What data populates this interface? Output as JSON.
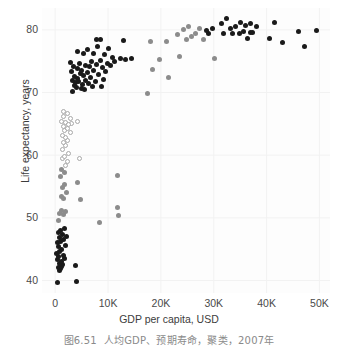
{
  "figure": {
    "caption_number": "图6.51",
    "caption_text": "人均GDP、预期寿命，聚类，2007年"
  },
  "chart_data": {
    "type": "scatter",
    "title": "",
    "xlabel": "GDP per capita, USD",
    "ylabel": "Life expectancy, years",
    "xlim": [
      -2500,
      52000
    ],
    "ylim": [
      38,
      83.5
    ],
    "xticks": [
      0,
      10000,
      20000,
      30000,
      40000,
      50000
    ],
    "xticklabels": [
      "0",
      "10K",
      "20K",
      "30K",
      "40K",
      "50K"
    ],
    "yticks": [
      40,
      50,
      60,
      70,
      80
    ],
    "yticklabels": [
      "40",
      "50",
      "60",
      "70",
      "80"
    ],
    "grid": true,
    "grid_color": "#f2f2f2",
    "background": "#fdfdfd",
    "legend": null,
    "marker_size": 5,
    "clusters": [
      {
        "name": "cluster-dark",
        "color": "#1a1a1a",
        "fill": "#1a1a1a",
        "stroke": "#1a1a1a"
      },
      {
        "name": "cluster-gray",
        "color": "#8c8c8c",
        "fill": "#8c8c8c",
        "stroke": "#8c8c8c"
      },
      {
        "name": "cluster-open",
        "color": "#b0b0b0",
        "fill": "#ffffff",
        "stroke": "#a8a8a8"
      }
    ],
    "points": [
      {
        "x": 430,
        "y": 39.6,
        "c": 0
      },
      {
        "x": 4000,
        "y": 39.8,
        "c": 0
      },
      {
        "x": 3800,
        "y": 42.4,
        "c": 0
      },
      {
        "x": 780,
        "y": 41.6,
        "c": 0
      },
      {
        "x": 950,
        "y": 41.9,
        "c": 0
      },
      {
        "x": 640,
        "y": 42.1,
        "c": 0
      },
      {
        "x": 1200,
        "y": 42.3,
        "c": 0
      },
      {
        "x": 1400,
        "y": 42.6,
        "c": 0
      },
      {
        "x": 870,
        "y": 42.7,
        "c": 0
      },
      {
        "x": 1100,
        "y": 43.0,
        "c": 0
      },
      {
        "x": 520,
        "y": 43.3,
        "c": 0
      },
      {
        "x": 1700,
        "y": 43.5,
        "c": 0
      },
      {
        "x": 700,
        "y": 43.8,
        "c": 0
      },
      {
        "x": 1500,
        "y": 44.0,
        "c": 0
      },
      {
        "x": 330,
        "y": 44.3,
        "c": 0
      },
      {
        "x": 900,
        "y": 44.7,
        "c": 0
      },
      {
        "x": 1250,
        "y": 45.0,
        "c": 0
      },
      {
        "x": 600,
        "y": 45.4,
        "c": 0
      },
      {
        "x": 1900,
        "y": 45.6,
        "c": 0
      },
      {
        "x": 450,
        "y": 46.0,
        "c": 0
      },
      {
        "x": 1050,
        "y": 46.2,
        "c": 0
      },
      {
        "x": 1600,
        "y": 46.5,
        "c": 0
      },
      {
        "x": 760,
        "y": 46.8,
        "c": 0
      },
      {
        "x": 2100,
        "y": 47.0,
        "c": 0
      },
      {
        "x": 1350,
        "y": 47.3,
        "c": 0
      },
      {
        "x": 560,
        "y": 47.6,
        "c": 0
      },
      {
        "x": 980,
        "y": 48.0,
        "c": 0
      },
      {
        "x": 1750,
        "y": 48.3,
        "c": 0
      },
      {
        "x": 8400,
        "y": 49.3,
        "c": 1
      },
      {
        "x": 680,
        "y": 49.6,
        "c": 1
      },
      {
        "x": 12000,
        "y": 50.4,
        "c": 1
      },
      {
        "x": 11700,
        "y": 51.6,
        "c": 1
      },
      {
        "x": 1480,
        "y": 50.6,
        "c": 1
      },
      {
        "x": 860,
        "y": 50.7,
        "c": 1
      },
      {
        "x": 1900,
        "y": 51.0,
        "c": 1
      },
      {
        "x": 1280,
        "y": 51.1,
        "c": 1
      },
      {
        "x": 4700,
        "y": 52.9,
        "c": 1
      },
      {
        "x": 1550,
        "y": 53.1,
        "c": 1
      },
      {
        "x": 1100,
        "y": 53.4,
        "c": 1
      },
      {
        "x": 2050,
        "y": 54.1,
        "c": 1
      },
      {
        "x": 1350,
        "y": 54.8,
        "c": 1
      },
      {
        "x": 4200,
        "y": 55.6,
        "c": 1
      },
      {
        "x": 1700,
        "y": 55.3,
        "c": 1
      },
      {
        "x": 11800,
        "y": 56.7,
        "c": 1
      },
      {
        "x": 1000,
        "y": 56.6,
        "c": 1
      },
      {
        "x": 1750,
        "y": 57.2,
        "c": 1
      },
      {
        "x": 1200,
        "y": 57.7,
        "c": 1
      },
      {
        "x": 1900,
        "y": 58.4,
        "c": 2
      },
      {
        "x": 4600,
        "y": 59.4,
        "c": 2
      },
      {
        "x": 2300,
        "y": 59.0,
        "c": 2
      },
      {
        "x": 1450,
        "y": 59.4,
        "c": 2
      },
      {
        "x": 1800,
        "y": 59.8,
        "c": 2
      },
      {
        "x": 2500,
        "y": 60.3,
        "c": 2
      },
      {
        "x": 1300,
        "y": 60.9,
        "c": 2
      },
      {
        "x": 1950,
        "y": 61.5,
        "c": 2
      },
      {
        "x": 1600,
        "y": 62.0,
        "c": 2
      },
      {
        "x": 2400,
        "y": 62.4,
        "c": 2
      },
      {
        "x": 2000,
        "y": 62.8,
        "c": 2
      },
      {
        "x": 1400,
        "y": 63.2,
        "c": 2
      },
      {
        "x": 2800,
        "y": 63.6,
        "c": 2
      },
      {
        "x": 1750,
        "y": 63.9,
        "c": 2
      },
      {
        "x": 2250,
        "y": 64.2,
        "c": 2
      },
      {
        "x": 1500,
        "y": 64.6,
        "c": 2
      },
      {
        "x": 3100,
        "y": 65.0,
        "c": 2
      },
      {
        "x": 1900,
        "y": 65.3,
        "c": 2
      },
      {
        "x": 2600,
        "y": 64.9,
        "c": 2
      },
      {
        "x": 4300,
        "y": 65.4,
        "c": 2
      },
      {
        "x": 1250,
        "y": 65.4,
        "c": 2
      },
      {
        "x": 2900,
        "y": 65.8,
        "c": 2
      },
      {
        "x": 1650,
        "y": 66.2,
        "c": 2
      },
      {
        "x": 2350,
        "y": 66.7,
        "c": 2
      },
      {
        "x": 1550,
        "y": 67.0,
        "c": 2
      },
      {
        "x": 17400,
        "y": 69.8,
        "c": 1
      },
      {
        "x": 3200,
        "y": 70.2,
        "c": 0
      },
      {
        "x": 5600,
        "y": 70.5,
        "c": 0
      },
      {
        "x": 4900,
        "y": 70.6,
        "c": 0
      },
      {
        "x": 4100,
        "y": 70.8,
        "c": 0
      },
      {
        "x": 7000,
        "y": 70.9,
        "c": 0
      },
      {
        "x": 8800,
        "y": 70.9,
        "c": 0
      },
      {
        "x": 3600,
        "y": 71.2,
        "c": 0
      },
      {
        "x": 5100,
        "y": 71.3,
        "c": 0
      },
      {
        "x": 6300,
        "y": 71.5,
        "c": 0
      },
      {
        "x": 3900,
        "y": 71.6,
        "c": 0
      },
      {
        "x": 4500,
        "y": 71.7,
        "c": 0
      },
      {
        "x": 7600,
        "y": 71.8,
        "c": 0
      },
      {
        "x": 3350,
        "y": 71.9,
        "c": 0
      },
      {
        "x": 5800,
        "y": 72.0,
        "c": 0
      },
      {
        "x": 9100,
        "y": 72.1,
        "c": 0
      },
      {
        "x": 4300,
        "y": 72.3,
        "c": 0
      },
      {
        "x": 6700,
        "y": 72.4,
        "c": 0
      },
      {
        "x": 21500,
        "y": 72.4,
        "c": 1
      },
      {
        "x": 3700,
        "y": 72.6,
        "c": 0
      },
      {
        "x": 5300,
        "y": 72.7,
        "c": 0
      },
      {
        "x": 8200,
        "y": 72.9,
        "c": 0
      },
      {
        "x": 4800,
        "y": 73.1,
        "c": 0
      },
      {
        "x": 6100,
        "y": 73.2,
        "c": 0
      },
      {
        "x": 3100,
        "y": 73.3,
        "c": 0
      },
      {
        "x": 9600,
        "y": 73.4,
        "c": 0
      },
      {
        "x": 7300,
        "y": 73.5,
        "c": 0
      },
      {
        "x": 5000,
        "y": 73.6,
        "c": 0
      },
      {
        "x": 18500,
        "y": 73.7,
        "c": 1
      },
      {
        "x": 4200,
        "y": 73.8,
        "c": 0
      },
      {
        "x": 8900,
        "y": 74.0,
        "c": 0
      },
      {
        "x": 6500,
        "y": 74.1,
        "c": 0
      },
      {
        "x": 3500,
        "y": 74.2,
        "c": 0
      },
      {
        "x": 10400,
        "y": 74.3,
        "c": 0
      },
      {
        "x": 5700,
        "y": 74.4,
        "c": 0
      },
      {
        "x": 7900,
        "y": 74.5,
        "c": 0
      },
      {
        "x": 4600,
        "y": 74.6,
        "c": 0
      },
      {
        "x": 9900,
        "y": 74.7,
        "c": 0
      },
      {
        "x": 2900,
        "y": 74.8,
        "c": 0
      },
      {
        "x": 11200,
        "y": 74.9,
        "c": 0
      },
      {
        "x": 6900,
        "y": 75.0,
        "c": 0
      },
      {
        "x": 8500,
        "y": 75.1,
        "c": 0
      },
      {
        "x": 13300,
        "y": 75.3,
        "c": 0
      },
      {
        "x": 14400,
        "y": 75.4,
        "c": 0
      },
      {
        "x": 19800,
        "y": 75.3,
        "c": 1
      },
      {
        "x": 30200,
        "y": 75.5,
        "c": 1
      },
      {
        "x": 10900,
        "y": 75.6,
        "c": 0
      },
      {
        "x": 12300,
        "y": 75.5,
        "c": 0
      },
      {
        "x": 23600,
        "y": 75.8,
        "c": 1
      },
      {
        "x": 5400,
        "y": 76.3,
        "c": 0
      },
      {
        "x": 7200,
        "y": 76.2,
        "c": 0
      },
      {
        "x": 9300,
        "y": 76.1,
        "c": 0
      },
      {
        "x": 4300,
        "y": 76.5,
        "c": 0
      },
      {
        "x": 6200,
        "y": 76.8,
        "c": 0
      },
      {
        "x": 10100,
        "y": 77.0,
        "c": 0
      },
      {
        "x": 8000,
        "y": 77.3,
        "c": 0
      },
      {
        "x": 47200,
        "y": 77.4,
        "c": 0
      },
      {
        "x": 43000,
        "y": 78.0,
        "c": 0
      },
      {
        "x": 12900,
        "y": 78.3,
        "c": 0
      },
      {
        "x": 7800,
        "y": 78.5,
        "c": 0
      },
      {
        "x": 8600,
        "y": 78.4,
        "c": 0
      },
      {
        "x": 18000,
        "y": 78.1,
        "c": 1
      },
      {
        "x": 21000,
        "y": 78.2,
        "c": 1
      },
      {
        "x": 24800,
        "y": 78.5,
        "c": 1
      },
      {
        "x": 28100,
        "y": 78.4,
        "c": 1
      },
      {
        "x": 25800,
        "y": 78.9,
        "c": 1
      },
      {
        "x": 40500,
        "y": 78.6,
        "c": 0
      },
      {
        "x": 36300,
        "y": 78.6,
        "c": 0
      },
      {
        "x": 26500,
        "y": 79.4,
        "c": 1
      },
      {
        "x": 23200,
        "y": 79.2,
        "c": 1
      },
      {
        "x": 31800,
        "y": 79.4,
        "c": 0
      },
      {
        "x": 33500,
        "y": 79.5,
        "c": 0
      },
      {
        "x": 34800,
        "y": 79.5,
        "c": 0
      },
      {
        "x": 29000,
        "y": 79.4,
        "c": 0
      },
      {
        "x": 36900,
        "y": 79.6,
        "c": 0
      },
      {
        "x": 35600,
        "y": 79.7,
        "c": 0
      },
      {
        "x": 37400,
        "y": 79.6,
        "c": 0
      },
      {
        "x": 46000,
        "y": 79.8,
        "c": 0
      },
      {
        "x": 49500,
        "y": 79.9,
        "c": 0
      },
      {
        "x": 24300,
        "y": 80.0,
        "c": 1
      },
      {
        "x": 27300,
        "y": 80.2,
        "c": 1
      },
      {
        "x": 29700,
        "y": 80.3,
        "c": 0
      },
      {
        "x": 33100,
        "y": 80.3,
        "c": 0
      },
      {
        "x": 34200,
        "y": 80.6,
        "c": 0
      },
      {
        "x": 36100,
        "y": 80.7,
        "c": 0
      },
      {
        "x": 38000,
        "y": 80.6,
        "c": 0
      },
      {
        "x": 31400,
        "y": 81.0,
        "c": 0
      },
      {
        "x": 35000,
        "y": 81.2,
        "c": 0
      },
      {
        "x": 37000,
        "y": 81.1,
        "c": 0
      },
      {
        "x": 25300,
        "y": 80.6,
        "c": 1
      },
      {
        "x": 41500,
        "y": 81.2,
        "c": 0
      },
      {
        "x": 32500,
        "y": 81.8,
        "c": 0
      },
      {
        "x": 28600,
        "y": 79.9,
        "c": 0
      }
    ]
  }
}
